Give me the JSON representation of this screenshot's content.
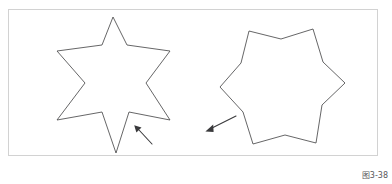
{
  "figure": {
    "caption": "图3-38",
    "background_color": "#ffffff",
    "frame_color": "#d2d2d2",
    "outline_color": "#4a4a4c",
    "arrow_color": "#3a3a3c",
    "caption_color": "#58585a",
    "frame": {
      "x": 8,
      "y": 9,
      "width": 370,
      "height": 147
    },
    "shapes": [
      {
        "name": "six-pointed-star-sharp",
        "label": "sharp six-pointed star",
        "points": "113,17 102,45 57,51 85,83 57,120 102,112 116,153 129,112 170,120 146,83 170,51 127,45"
      },
      {
        "name": "six-pointed-star-blunted",
        "label": "blunted six-pointed star",
        "points": "249,31 281,39 313,29 323,62 345,83 322,105 316,143 285,135 253,144 243,112 220,87 241,63"
      }
    ],
    "arrows": [
      {
        "name": "annotation-arrow-left",
        "label": "arrow pointing to sharp star concave vertex",
        "tail_x": 152,
        "tail_y": 144,
        "tip_x": 135,
        "tip_y": 126
      },
      {
        "name": "annotation-arrow-right",
        "label": "arrow pointing away from blunted star",
        "tail_x": 236,
        "tail_y": 116,
        "tip_x": 206,
        "tip_y": 131
      }
    ]
  }
}
